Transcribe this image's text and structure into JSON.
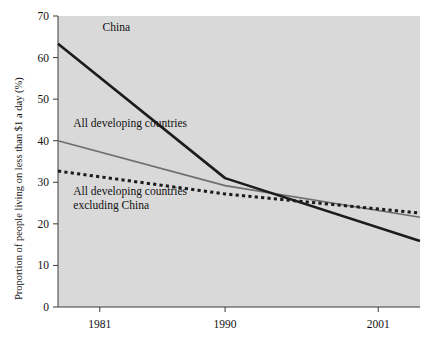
{
  "chart_data": {
    "type": "line",
    "title": "",
    "subtitle": "",
    "xlabel": "",
    "ylabel": "Proportion of people living on less than $1 a day (%)",
    "xlim": [
      1978,
      2004
    ],
    "ylim": [
      0,
      70
    ],
    "grid": false,
    "legend_position": "inline-annotations",
    "background": "#d9d9d9",
    "x_tick_labels": [
      "1981",
      "1990",
      "2001"
    ],
    "x_ticks": [
      1981,
      1990,
      2001
    ],
    "y_tick_labels": [
      "0",
      "10",
      "20",
      "30",
      "40",
      "50",
      "60",
      "70"
    ],
    "y_ticks": [
      0,
      10,
      20,
      30,
      40,
      50,
      60,
      70
    ],
    "series": [
      {
        "name": "China",
        "color": "#1c1c1c",
        "style": "solid-thick",
        "annotation": "China",
        "annotation_x": 1981.2,
        "annotation_y": 66.5,
        "x": [
          1978,
          1990,
          2004
        ],
        "values": [
          63.3,
          31.0,
          15.9
        ]
      },
      {
        "name": "All developing countries",
        "color": "#6e6e6e",
        "style": "solid-medium",
        "annotation": "All developing countries",
        "annotation_x": 1979.1,
        "annotation_y": 43.2,
        "x": [
          1978,
          1990,
          2004
        ],
        "values": [
          40.0,
          29.2,
          21.6
        ]
      },
      {
        "name": "All developing countries excluding China",
        "color": "#1c1c1c",
        "style": "dotted",
        "annotation": "All developing countries\nexcluding China",
        "annotation_line1": "All developing countries",
        "annotation_line2": "excluding China",
        "annotation_x": 1979.1,
        "annotation_y": 27.0,
        "x": [
          1978,
          1990,
          2004
        ],
        "values": [
          32.7,
          27.2,
          22.6
        ]
      }
    ]
  },
  "axis": {
    "y_title": "Proportion of people living on less than $1 a day (%)"
  },
  "annotations": {
    "china": "China",
    "all_developing": "All developing countries",
    "excluding_china_line1": "All developing countries",
    "excluding_china_line2": "excluding China"
  },
  "ticks": {
    "y": [
      "70",
      "60",
      "50",
      "40",
      "30",
      "20",
      "10",
      "0"
    ],
    "x": [
      "1981",
      "1990",
      "2001"
    ]
  }
}
